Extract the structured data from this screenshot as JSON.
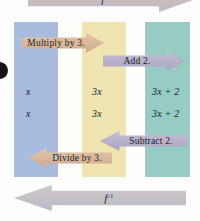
{
  "figure": {
    "columns": [
      {
        "id": "input",
        "label": "x",
        "color": "#a8bcdf"
      },
      {
        "id": "middle",
        "label": "3x",
        "color": "#efe5b0"
      },
      {
        "id": "output",
        "label": "3x + 2",
        "color": "#96ccc2"
      }
    ],
    "rows": {
      "forward_row": {
        "input": "x",
        "middle": "3x",
        "output": "3x + 2"
      },
      "inverse_row": {
        "input": "x",
        "middle": "3x",
        "output": "3x + 2"
      }
    },
    "operations": {
      "forward": [
        {
          "id": "multiply",
          "label": "Multiply by 3.",
          "direction": "right",
          "color": "#d9b79b"
        },
        {
          "id": "add",
          "label": "Add 2.",
          "direction": "right",
          "color": "#b6b0cb"
        }
      ],
      "inverse": [
        {
          "id": "subtract",
          "label": "Subtract 2.",
          "direction": "left",
          "color": "#b6b0cb"
        },
        {
          "id": "divide",
          "label": "Divide by 3.",
          "direction": "left",
          "color": "#d9b79b"
        }
      ]
    },
    "function_arrows": {
      "forward": {
        "label": "f",
        "superscript": "",
        "direction": "right",
        "color": "#c6bfc4"
      },
      "inverse": {
        "label": "f",
        "superscript": "-1",
        "direction": "left",
        "color": "#c0c0c9"
      }
    }
  }
}
